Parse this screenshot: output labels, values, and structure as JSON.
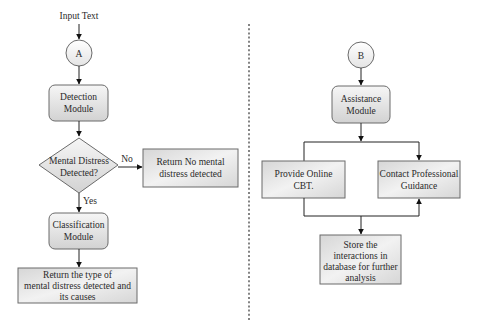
{
  "left_flow": {
    "input_label": "Input Text",
    "connector": "A",
    "detection": [
      "Detection",
      "Module"
    ],
    "decision": [
      "Mental Distress",
      "Detected?"
    ],
    "no_label": "No",
    "yes_label": "Yes",
    "no_result": [
      "Return No mental",
      "distress detected"
    ],
    "classification": [
      "Classification",
      "Module"
    ],
    "final_result": [
      "Return the type of",
      "mental distress detected and",
      "its causes"
    ]
  },
  "right_flow": {
    "connector": "B",
    "assistance": [
      "Assistance",
      "Module"
    ],
    "cbt": [
      "Provide Online",
      "CBT."
    ],
    "professional": [
      "Contact Professional",
      "Guidance"
    ],
    "store": [
      "Store the",
      "interactions in",
      "database for further",
      "analysis"
    ]
  },
  "colors": {
    "box_fill_top": "#ffffff",
    "box_fill_bottom": "#d4d4d4",
    "stroke": "#222222",
    "divider": "#333333"
  }
}
